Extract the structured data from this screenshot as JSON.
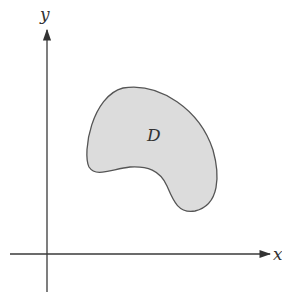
{
  "diagram": {
    "axes": {
      "x_label": "x",
      "y_label": "y",
      "color": "#3a3a3a"
    },
    "region": {
      "label": "D",
      "fill": "#dcdcdc",
      "stroke": "#555555"
    }
  }
}
